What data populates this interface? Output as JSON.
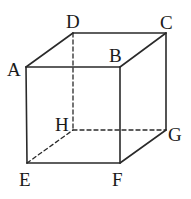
{
  "diagram": {
    "type": "cube",
    "colors": {
      "edge": "#2a2a2a",
      "label": "#1a1a1a",
      "background": "#ffffff"
    },
    "vertices": {
      "A": {
        "x": 26,
        "y": 67
      },
      "B": {
        "x": 120,
        "y": 67
      },
      "C": {
        "x": 166,
        "y": 33
      },
      "D": {
        "x": 73,
        "y": 33
      },
      "E": {
        "x": 27,
        "y": 163
      },
      "F": {
        "x": 120,
        "y": 163
      },
      "G": {
        "x": 166,
        "y": 130
      },
      "H": {
        "x": 73,
        "y": 130
      }
    },
    "labels": {
      "A": "A",
      "B": "B",
      "C": "C",
      "D": "D",
      "E": "E",
      "F": "F",
      "G": "G",
      "H": "H"
    },
    "visible_edges": [
      "AB",
      "BC",
      "CD",
      "DA",
      "AE",
      "BF",
      "CG",
      "EF",
      "FG"
    ],
    "hidden_edges": [
      "DH",
      "EH",
      "HG"
    ]
  }
}
